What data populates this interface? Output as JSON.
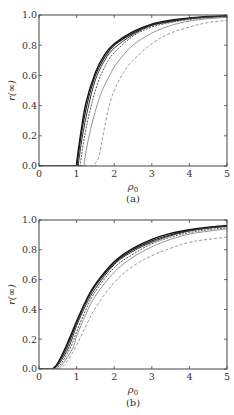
{
  "chart_data": [
    {
      "type": "line",
      "panel": "a",
      "caption": "(a)",
      "xlabel": "ρ0",
      "ylabel": "r(∞)",
      "xlim": [
        0,
        5
      ],
      "ylim": [
        0,
        1
      ],
      "xticks": [
        "0",
        "1",
        "2",
        "3",
        "4",
        "5"
      ],
      "yticks": [
        "0.0",
        "0.2",
        "0.4",
        "0.6",
        "0.8",
        "1.0"
      ],
      "grid": false,
      "series": [
        {
          "name": "curve-1",
          "style": "solid",
          "color": "#111111",
          "x": [
            0,
            0.98,
            1.0,
            1.1,
            1.25,
            1.5,
            1.75,
            2.0,
            2.5,
            3.0,
            3.5,
            4.0,
            4.5,
            5.0
          ],
          "y": [
            0,
            0,
            0.02,
            0.2,
            0.42,
            0.62,
            0.74,
            0.81,
            0.89,
            0.94,
            0.965,
            0.98,
            0.99,
            0.995
          ]
        },
        {
          "name": "curve-2",
          "style": "solid",
          "color": "#222222",
          "x": [
            0,
            1.0,
            1.02,
            1.12,
            1.27,
            1.5,
            1.75,
            2.0,
            2.5,
            3.0,
            3.5,
            4.0,
            4.5,
            5.0
          ],
          "y": [
            0,
            0,
            0.02,
            0.2,
            0.4,
            0.6,
            0.72,
            0.8,
            0.88,
            0.935,
            0.96,
            0.978,
            0.988,
            0.993
          ]
        },
        {
          "name": "curve-3",
          "style": "solid",
          "color": "#333333",
          "x": [
            0,
            1.03,
            1.05,
            1.15,
            1.3,
            1.5,
            1.75,
            2.0,
            2.5,
            3.0,
            3.5,
            4.0,
            4.5,
            5.0
          ],
          "y": [
            0,
            0,
            0.02,
            0.19,
            0.38,
            0.57,
            0.7,
            0.78,
            0.87,
            0.93,
            0.955,
            0.975,
            0.985,
            0.99
          ]
        },
        {
          "name": "curve-4",
          "style": "dashdot",
          "color": "#555555",
          "x": [
            0,
            1.08,
            1.1,
            1.2,
            1.35,
            1.55,
            1.8,
            2.0,
            2.5,
            3.0,
            3.5,
            4.0,
            4.5,
            5.0
          ],
          "y": [
            0,
            0,
            0.02,
            0.18,
            0.36,
            0.54,
            0.68,
            0.75,
            0.86,
            0.92,
            0.95,
            0.97,
            0.982,
            0.988
          ]
        },
        {
          "name": "curve-5",
          "style": "solid",
          "color": "#888888",
          "x": [
            0,
            1.18,
            1.2,
            1.3,
            1.45,
            1.65,
            1.9,
            2.1,
            2.5,
            3.0,
            3.5,
            4.0,
            4.5,
            5.0
          ],
          "y": [
            0,
            0,
            0.02,
            0.16,
            0.32,
            0.48,
            0.61,
            0.69,
            0.8,
            0.88,
            0.93,
            0.96,
            0.975,
            0.985
          ]
        },
        {
          "name": "curve-6",
          "style": "dashed",
          "color": "#999999",
          "x": [
            0,
            1.4,
            1.5,
            1.6,
            1.7,
            1.85,
            2.0,
            2.25,
            2.5,
            3.0,
            3.5,
            4.0,
            4.5,
            5.0
          ],
          "y": [
            0,
            0,
            0.02,
            0.07,
            0.2,
            0.38,
            0.5,
            0.62,
            0.7,
            0.81,
            0.88,
            0.92,
            0.95,
            0.965
          ]
        }
      ]
    },
    {
      "type": "line",
      "panel": "b",
      "caption": "(b)",
      "xlabel": "ρ0",
      "ylabel": "r(∞)",
      "xlim": [
        0,
        5
      ],
      "ylim": [
        0,
        1
      ],
      "xticks": [
        "0",
        "1",
        "2",
        "3",
        "4",
        "5"
      ],
      "yticks": [
        "0.0",
        "0.2",
        "0.4",
        "0.6",
        "0.8",
        "1.0"
      ],
      "grid": false,
      "series": [
        {
          "name": "curve-1",
          "style": "solid",
          "color": "#111111",
          "x": [
            0,
            0.33,
            0.4,
            0.5,
            0.75,
            1.0,
            1.25,
            1.5,
            2.0,
            2.5,
            3.0,
            3.5,
            4.0,
            4.5,
            5.0
          ],
          "y": [
            0,
            0,
            0.01,
            0.04,
            0.17,
            0.32,
            0.46,
            0.57,
            0.72,
            0.81,
            0.87,
            0.91,
            0.935,
            0.952,
            0.963
          ]
        },
        {
          "name": "curve-2",
          "style": "solid",
          "color": "#222222",
          "x": [
            0,
            0.35,
            0.42,
            0.52,
            0.77,
            1.0,
            1.25,
            1.5,
            2.0,
            2.5,
            3.0,
            3.5,
            4.0,
            4.5,
            5.0
          ],
          "y": [
            0,
            0,
            0.01,
            0.04,
            0.16,
            0.31,
            0.45,
            0.56,
            0.71,
            0.8,
            0.86,
            0.9,
            0.93,
            0.948,
            0.96
          ]
        },
        {
          "name": "curve-3",
          "style": "solid",
          "color": "#333333",
          "x": [
            0,
            0.37,
            0.44,
            0.55,
            0.8,
            1.0,
            1.25,
            1.5,
            2.0,
            2.5,
            3.0,
            3.5,
            4.0,
            4.5,
            5.0
          ],
          "y": [
            0,
            0,
            0.01,
            0.04,
            0.15,
            0.29,
            0.43,
            0.54,
            0.7,
            0.79,
            0.85,
            0.895,
            0.925,
            0.945,
            0.957
          ]
        },
        {
          "name": "curve-4",
          "style": "dashdot",
          "color": "#555555",
          "x": [
            0,
            0.4,
            0.48,
            0.6,
            0.85,
            1.0,
            1.25,
            1.5,
            2.0,
            2.5,
            3.0,
            3.5,
            4.0,
            4.5,
            5.0
          ],
          "y": [
            0,
            0,
            0.01,
            0.04,
            0.15,
            0.25,
            0.4,
            0.52,
            0.68,
            0.77,
            0.84,
            0.885,
            0.915,
            0.935,
            0.948
          ]
        },
        {
          "name": "curve-5",
          "style": "solid",
          "color": "#888888",
          "x": [
            0,
            0.45,
            0.53,
            0.65,
            0.9,
            1.0,
            1.25,
            1.5,
            2.0,
            2.5,
            3.0,
            3.5,
            4.0,
            4.5,
            5.0
          ],
          "y": [
            0,
            0,
            0.01,
            0.04,
            0.14,
            0.22,
            0.37,
            0.49,
            0.65,
            0.75,
            0.82,
            0.87,
            0.905,
            0.925,
            0.94
          ]
        },
        {
          "name": "curve-6",
          "style": "dashed",
          "color": "#999999",
          "x": [
            0,
            0.5,
            0.6,
            0.75,
            1.0,
            1.25,
            1.5,
            2.0,
            2.5,
            3.0,
            3.5,
            4.0,
            4.5,
            5.0
          ],
          "y": [
            0,
            0,
            0.01,
            0.05,
            0.16,
            0.29,
            0.41,
            0.58,
            0.69,
            0.76,
            0.81,
            0.85,
            0.87,
            0.885
          ]
        }
      ]
    }
  ]
}
